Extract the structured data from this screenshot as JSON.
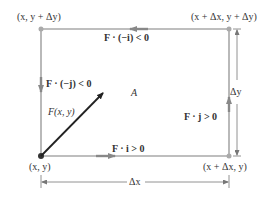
{
  "diagram": {
    "corners": {
      "bottom_left": "(x, y)",
      "top_left": "(x, y + Δy)",
      "top_right": "(x + Δx, y + Δy)",
      "bottom_right": "(x + Δx, y)"
    },
    "edge_labels": {
      "top": "F · (−i) < 0",
      "left": "F · (−j) < 0",
      "bottom": "F · i > 0",
      "right": "F · j > 0"
    },
    "vector_label": "F(x, y)",
    "region_label": "A",
    "dimensions": {
      "width": "Δx",
      "height": "Δy"
    },
    "colors": {
      "rectangle": "#a8a8a8",
      "vector": "#222222",
      "text": "#333333"
    }
  }
}
